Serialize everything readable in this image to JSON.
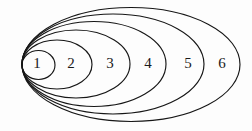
{
  "figure": {
    "kind": "nested-ellipses-diagram",
    "width": 252,
    "height": 131,
    "background_color": "#fdfdfd",
    "stroke_color": "#161616",
    "label_color": "#1a1a1a",
    "stroke_width": 1.15,
    "common_tangent": {
      "x": 22,
      "y": 65
    },
    "ellipses": [
      {
        "label": "1",
        "cx": 38.5,
        "cy": 65,
        "rx": 16.5,
        "ry": 14.5,
        "label_x": 37,
        "label_y": 65
      },
      {
        "label": "2",
        "cx": 57.0,
        "cy": 64.5,
        "rx": 35.0,
        "ry": 24.5,
        "label_x": 71,
        "label_y": 65
      },
      {
        "label": "3",
        "cx": 76.0,
        "cy": 64.0,
        "rx": 54.0,
        "ry": 34.0,
        "label_x": 110,
        "label_y": 65
      },
      {
        "label": "4",
        "cx": 94.0,
        "cy": 64.0,
        "rx": 72.0,
        "ry": 42.5,
        "label_x": 148,
        "label_y": 65
      },
      {
        "label": "5",
        "cx": 113.0,
        "cy": 64.0,
        "rx": 91.0,
        "ry": 50.0,
        "label_x": 188,
        "label_y": 65
      },
      {
        "label": "6",
        "cx": 131.0,
        "cy": 64.5,
        "rx": 109.0,
        "ry": 57.0,
        "label_x": 222,
        "label_y": 65
      }
    ]
  }
}
